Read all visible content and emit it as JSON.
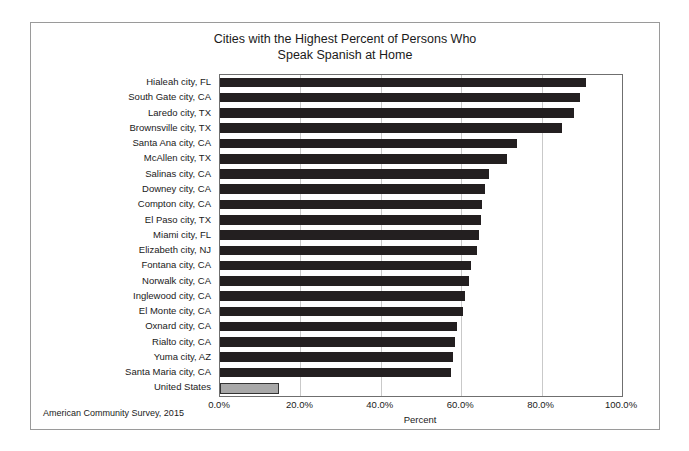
{
  "chart_data": {
    "type": "bar",
    "orientation": "horizontal",
    "title": "Cities with the Highest Percent of Persons Who Speak Spanish at Home",
    "title_lines": [
      "Cities with the Highest Percent of Persons Who",
      "Speak Spanish at Home"
    ],
    "xlabel": "Percent",
    "ylabel": "",
    "xlim": [
      0,
      100
    ],
    "grid": true,
    "legend": "none",
    "source_note": "American Community Survey, 2015",
    "xticks": [
      "0.0%",
      "20.0%",
      "40.0%",
      "60.0%",
      "80.0%",
      "100.0%"
    ],
    "xtick_values": [
      0,
      20,
      40,
      60,
      80,
      100
    ],
    "bar_color": "#231f20",
    "highlight_color": "#a8a8a8",
    "categories": [
      "Hialeah city, FL",
      "South Gate city, CA",
      "Laredo city, TX",
      "Brownsville city, TX",
      "Santa Ana city, CA",
      "McAllen city, TX",
      "Salinas city, CA",
      "Downey city, CA",
      "Compton city, CA",
      "El Paso city, TX",
      "Miami city, FL",
      "Elizabeth city, NJ",
      "Fontana city, CA",
      "Norwalk city, CA",
      "Inglewood city, CA",
      "El Monte city, CA",
      "Oxnard city, CA",
      "Rialto city, CA",
      "Yuma city, AZ",
      "Santa Maria city, CA",
      "United States"
    ],
    "values": [
      91.0,
      89.5,
      88.0,
      85.0,
      74.0,
      71.5,
      67.0,
      66.0,
      65.2,
      65.0,
      64.5,
      64.0,
      62.5,
      62.0,
      61.0,
      60.5,
      59.0,
      58.5,
      58.0,
      57.5,
      14.7
    ],
    "highlighted": [
      "United States"
    ]
  }
}
